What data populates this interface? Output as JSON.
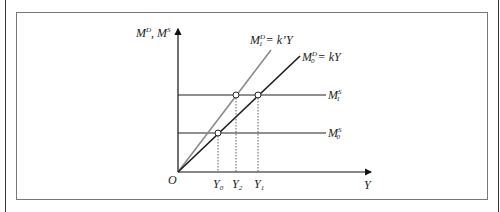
{
  "diagram": {
    "y_axis_label": {
      "base": "M",
      "sup1": "D",
      "sep": ", M",
      "sup2": "S"
    },
    "x_axis_label": "Y",
    "origin_label": "O",
    "curves": [
      {
        "name": "M1D",
        "base": "M",
        "sub": "1",
        "sup": "D",
        "eq": " = k’Y",
        "color": "#8a8a8a"
      },
      {
        "name": "M0D",
        "base": "M",
        "sub": "0",
        "sup": "D",
        "eq": " = kY",
        "color": "#1a1a1a"
      }
    ],
    "supply_lines": [
      {
        "name": "M1S",
        "base": "M",
        "sub": "1",
        "sup": "S"
      },
      {
        "name": "M0S",
        "base": "M",
        "sub": "0",
        "sup": "S"
      }
    ],
    "x_ticks": [
      {
        "base": "Y",
        "sub": "0"
      },
      {
        "base": "Y",
        "sub": "2"
      },
      {
        "base": "Y",
        "sub": "1"
      }
    ],
    "colors": {
      "axis": "#111111",
      "demand_new": "#8a8a8a",
      "demand_old": "#1a1a1a",
      "frame": "#777777"
    }
  }
}
